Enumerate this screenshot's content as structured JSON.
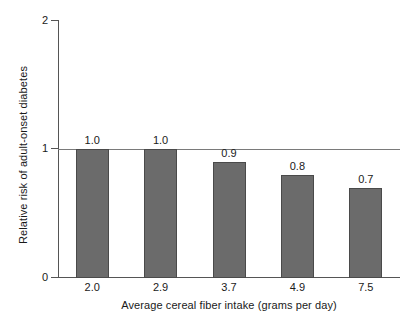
{
  "chart_data": {
    "type": "bar",
    "title": "",
    "xlabel": "Average cereal fiber intake (grams per day)",
    "ylabel": "Relative risk of adult-onset diabetes",
    "categories": [
      "2.0",
      "2.9",
      "3.7",
      "4.9",
      "7.5"
    ],
    "values": [
      1.0,
      1.0,
      0.9,
      0.8,
      0.7
    ],
    "value_labels": [
      "1.0",
      "1.0",
      "0.9",
      "0.8",
      "0.7"
    ],
    "ylim": [
      0,
      2
    ],
    "yticks": [
      0,
      1,
      2
    ],
    "ytick_labels": [
      "0",
      "1",
      "2"
    ],
    "grid": false,
    "legend": null,
    "reference_line": {
      "axis": "y",
      "value": 1,
      "color": "#7a7a7a"
    },
    "bar_color": "#6b6b6b",
    "bar_edge_color": "#4a4a4a",
    "background_color": "#ffffff",
    "axis_color": "#555555",
    "text_color": "#1a1a1a"
  }
}
